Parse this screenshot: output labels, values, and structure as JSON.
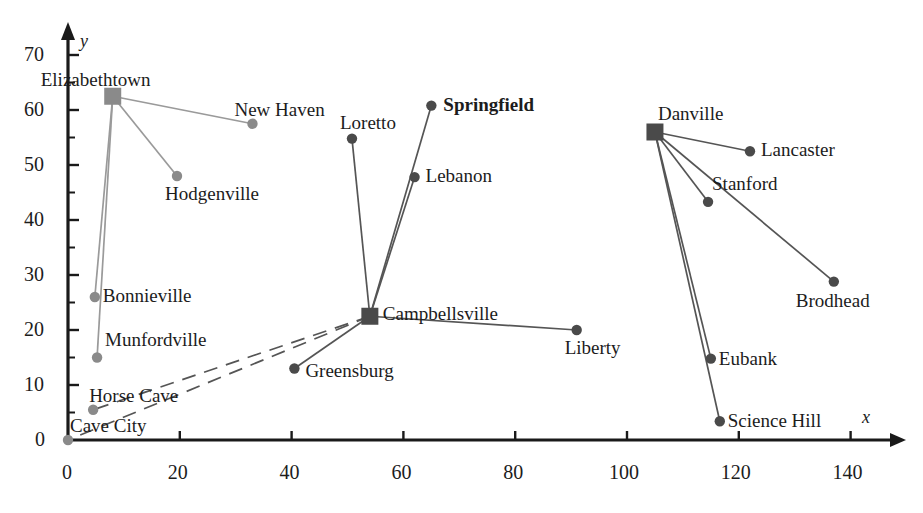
{
  "chart_data": {
    "type": "scatter",
    "title": "",
    "xlabel": "x",
    "ylabel": "y",
    "xlim": [
      0,
      145
    ],
    "ylim": [
      0,
      73
    ],
    "grid": false,
    "legend": null,
    "xticks": [
      0,
      20,
      40,
      60,
      80,
      100,
      120,
      140
    ],
    "yticks": [
      0,
      10,
      20,
      30,
      40,
      50,
      60,
      70
    ],
    "minor_y_ticks": [
      5,
      15,
      25,
      35,
      45,
      55,
      65
    ],
    "hub_marker": "square",
    "leaf_marker": "circle",
    "nodes": [
      {
        "name": "Elizabethtown",
        "x": 8,
        "y": 62.5,
        "role": "hub",
        "label_dx": -72,
        "label_dy": -26,
        "bold": false
      },
      {
        "name": "New Haven",
        "x": 33,
        "y": 57.5,
        "role": "leaf",
        "label_dx": -18,
        "label_dy": -24,
        "bold": false
      },
      {
        "name": "Hodgenville",
        "x": 19.5,
        "y": 48,
        "role": "leaf",
        "label_dx": -12,
        "label_dy": 8,
        "bold": false
      },
      {
        "name": "Bonnieville",
        "x": 4.8,
        "y": 26,
        "role": "leaf",
        "label_dx": 8,
        "label_dy": -11,
        "bold": false
      },
      {
        "name": "Munfordville",
        "x": 5.2,
        "y": 15,
        "role": "leaf",
        "label_dx": 8,
        "label_dy": -28,
        "bold": false
      },
      {
        "name": "Horse Cave",
        "x": 4.5,
        "y": 5.5,
        "role": "leaf",
        "label_dx": -4,
        "label_dy": -24,
        "bold": false
      },
      {
        "name": "Cave City",
        "x": 0,
        "y": 0,
        "role": "leaf",
        "label_dx": 2,
        "label_dy": -24,
        "bold": false
      },
      {
        "name": "Loretto",
        "x": 50.8,
        "y": 54.8,
        "role": "leaf",
        "label_dx": -12,
        "label_dy": -26,
        "bold": false
      },
      {
        "name": "Springfield",
        "x": 65,
        "y": 60.8,
        "role": "leaf",
        "label_dx": 12,
        "label_dy": -11,
        "bold": true
      },
      {
        "name": "Lebanon",
        "x": 62,
        "y": 47.8,
        "role": "leaf",
        "label_dx": 11,
        "label_dy": -11,
        "bold": false
      },
      {
        "name": "Campbellsville",
        "x": 54,
        "y": 22.5,
        "role": "hub",
        "label_dx": 13,
        "label_dy": -12,
        "bold": false
      },
      {
        "name": "Greensburg",
        "x": 40.5,
        "y": 13,
        "role": "leaf",
        "label_dx": 11,
        "label_dy": -8,
        "bold": false
      },
      {
        "name": "Liberty",
        "x": 91,
        "y": 20,
        "role": "leaf",
        "label_dx": -12,
        "label_dy": 8,
        "bold": false
      },
      {
        "name": "Danville",
        "x": 105,
        "y": 56,
        "role": "hub",
        "label_dx": 3,
        "label_dy": -28,
        "bold": false
      },
      {
        "name": "Lancaster",
        "x": 122,
        "y": 52.5,
        "role": "leaf",
        "label_dx": 11,
        "label_dy": -11,
        "bold": false
      },
      {
        "name": "Stanford",
        "x": 114.5,
        "y": 43.3,
        "role": "leaf",
        "label_dx": 4,
        "label_dy": -28,
        "bold": false
      },
      {
        "name": "Brodhead",
        "x": 137,
        "y": 28.8,
        "role": "leaf",
        "label_dx": -38,
        "label_dy": 9,
        "bold": false
      },
      {
        "name": "Eubank",
        "x": 115,
        "y": 14.8,
        "role": "leaf",
        "label_dx": 8,
        "label_dy": -10,
        "bold": false
      },
      {
        "name": "Science Hill",
        "x": 116.6,
        "y": 3.4,
        "role": "leaf",
        "label_dx": 8,
        "label_dy": -10,
        "bold": false
      }
    ],
    "edges": [
      {
        "from": "Elizabethtown",
        "to": "New Haven",
        "style": "solid"
      },
      {
        "from": "Elizabethtown",
        "to": "Hodgenville",
        "style": "solid"
      },
      {
        "from": "Elizabethtown",
        "to": "Bonnieville",
        "style": "solid"
      },
      {
        "from": "Elizabethtown",
        "to": "Munfordville",
        "style": "solid"
      },
      {
        "from": "Campbellsville",
        "to": "Loretto",
        "style": "solid"
      },
      {
        "from": "Campbellsville",
        "to": "Springfield",
        "style": "solid"
      },
      {
        "from": "Campbellsville",
        "to": "Lebanon",
        "style": "solid"
      },
      {
        "from": "Campbellsville",
        "to": "Greensburg",
        "style": "solid"
      },
      {
        "from": "Campbellsville",
        "to": "Liberty",
        "style": "solid"
      },
      {
        "from": "Campbellsville",
        "to": "Horse Cave",
        "style": "dashed"
      },
      {
        "from": "Campbellsville",
        "to": "Cave City",
        "style": "dashed"
      },
      {
        "from": "Danville",
        "to": "Lancaster",
        "style": "solid"
      },
      {
        "from": "Danville",
        "to": "Stanford",
        "style": "solid"
      },
      {
        "from": "Danville",
        "to": "Brodhead",
        "style": "solid"
      },
      {
        "from": "Danville",
        "to": "Eubank",
        "style": "solid"
      },
      {
        "from": "Danville",
        "to": "Science Hill",
        "style": "solid"
      }
    ],
    "colors": {
      "axis": "#1a1a1a",
      "marker_light": "#8a8a8a",
      "marker_dark": "#4a4a4a",
      "edge_light": "#9a9a9a",
      "edge_dark": "#555555",
      "text": "#1c1c1c"
    }
  }
}
